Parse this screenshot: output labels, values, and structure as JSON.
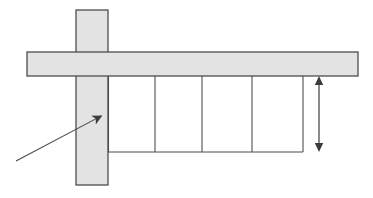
{
  "figure": {
    "title": "",
    "caption": "",
    "background_color": "#ffffff"
  },
  "style": {
    "band_fill": "#e3e3e3",
    "band_stroke": "#4d4d4d",
    "band_stroke_width": 1.3,
    "cell_stroke": "#4d4d4d",
    "cell_stroke_width": 1.1,
    "arrow_color": "#3c3c3c",
    "leader_color": "#4a4a4a",
    "leader_width": 1.1,
    "dimension_width": 1.2
  },
  "canvas": {
    "width": 373,
    "height": 198
  },
  "shapes": {
    "vertical_band": {
      "name": "vertical-band",
      "x": 76,
      "y": 10,
      "width": 32,
      "height": 175
    },
    "horizontal_band": {
      "name": "horizontal-band",
      "x": 27,
      "y": 52,
      "width": 331,
      "height": 24
    },
    "cells": {
      "name": "cell-row",
      "x": 108,
      "y": 76,
      "width": 195,
      "height": 76,
      "count": 4,
      "dividers_x": [
        155,
        202,
        252
      ],
      "left_x": 108,
      "right_x": 303,
      "top_y": 76,
      "bottom_y": 152
    }
  },
  "annotations": {
    "leader_arrow": {
      "name": "leader-arrow",
      "label": "",
      "tail_x": 16,
      "tail_y": 161,
      "tip_x": 105,
      "tip_y": 114,
      "head_size": 9
    },
    "dimension_arrow": {
      "name": "dimension-arrow",
      "label": "",
      "x": 319,
      "top_y": 76,
      "bottom_y": 152,
      "head_size": 7,
      "double_headed": true
    }
  },
  "labels": {
    "items": []
  }
}
